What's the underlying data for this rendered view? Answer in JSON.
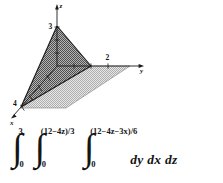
{
  "figure": {
    "caption_text": "",
    "diagram": {
      "title": "tetrahedron-in-first-octant",
      "axes": [
        {
          "name": "z-axis",
          "label": "z"
        },
        {
          "name": "y-axis",
          "label": "y"
        },
        {
          "name": "x-axis",
          "label": "x"
        }
      ],
      "ticks": [
        {
          "axis": "z",
          "label": "3",
          "value": 3
        },
        {
          "axis": "y",
          "label": "2",
          "value": 2
        },
        {
          "axis": "x",
          "label": "4",
          "value": 4
        }
      ],
      "colors": {
        "solid_fill": "#8c8c8c",
        "plane_fill": "#cfcfcf",
        "edge": "#1a1a1a",
        "axis": "#1a1a1a"
      }
    },
    "integral": {
      "outer": {
        "name": "outer-integral",
        "lower": "0",
        "upper": "3"
      },
      "middle": {
        "name": "middle-integral",
        "lower": "0",
        "upper": "(12−4z)/3"
      },
      "inner": {
        "name": "inner-integral",
        "lower": "0",
        "upper": "(12−4z−3x)/6"
      },
      "differentials": "dy dx dz",
      "integral_sign": "∫"
    }
  }
}
